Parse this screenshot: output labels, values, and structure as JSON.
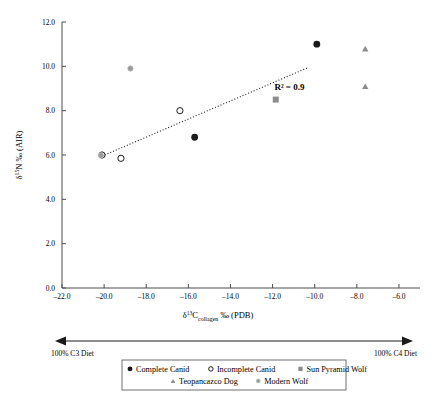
{
  "chart_data": {
    "type": "scatter",
    "title": "",
    "xlabel": "d13C collagen per mil (PDB)",
    "ylabel": "d15N per mil (AIR)",
    "xlabel_parts": {
      "delta": "δ",
      "sup": "13",
      "element": "C",
      "sub": "collagen",
      "tail": "‰ (PDB)"
    },
    "ylabel_parts": {
      "delta": "δ",
      "sup": "15",
      "element": "N",
      "tail": "‰ (AIR)"
    },
    "xlim": [
      -22.0,
      -5.0
    ],
    "ylim": [
      0.0,
      12.0
    ],
    "xticks": [
      -22.0,
      -20.0,
      -18.0,
      -16.0,
      -14.0,
      -12.0,
      -10.0,
      -8.0,
      -6.0
    ],
    "xtick_labels": [
      "–22.0",
      "–20.0",
      "–18.0",
      "–16.0",
      "–14.0",
      "–12.0",
      "–10.0",
      "–8.0",
      "–6.0"
    ],
    "yticks": [
      0.0,
      2.0,
      4.0,
      6.0,
      8.0,
      10.0,
      12.0
    ],
    "ytick_labels": [
      "0.0",
      "2.0",
      "4.0",
      "6.0",
      "8.0",
      "10.0",
      "12.0"
    ],
    "grid": false,
    "legend_position": "bottom-center",
    "annotations": [
      {
        "text": "R² = 0.9",
        "x": -11.2,
        "y": 8.95
      }
    ],
    "trendline": {
      "label": "R² = 0.9",
      "r_squared": 0.9,
      "style": "dotted",
      "x_start": -20.1,
      "y_start": 5.95,
      "x_end": -10.3,
      "y_end": 9.95
    },
    "series": [
      {
        "name": "Complete Canid",
        "marker": "filled-circle",
        "color": "#1a1a1a",
        "points": [
          {
            "x": -15.7,
            "y": 6.8
          },
          {
            "x": -9.9,
            "y": 11.0
          }
        ]
      },
      {
        "name": "Incomplete Canid",
        "marker": "open-circle",
        "color": "#1a1a1a",
        "points": [
          {
            "x": -20.1,
            "y": 6.0
          },
          {
            "x": -19.2,
            "y": 5.85
          },
          {
            "x": -16.4,
            "y": 8.0
          }
        ]
      },
      {
        "name": "Sun Pyramid Wolf",
        "marker": "filled-square",
        "color": "#8c8c8c",
        "points": [
          {
            "x": -11.85,
            "y": 8.5
          }
        ]
      },
      {
        "name": "Teopancazco Dog",
        "marker": "filled-triangle",
        "color": "#8c8c8c",
        "points": [
          {
            "x": -7.6,
            "y": 10.8
          },
          {
            "x": -7.6,
            "y": 9.1
          }
        ]
      },
      {
        "name": "Modern Wolf",
        "marker": "gray-dot",
        "color": "#9a9a9a",
        "points": [
          {
            "x": -18.75,
            "y": 9.9
          },
          {
            "x": -20.15,
            "y": 5.98
          }
        ]
      }
    ]
  },
  "diet_axis": {
    "left_label": "100% C3 Diet",
    "right_label": "100% C4 Diet"
  },
  "legend": {
    "rows": [
      [
        {
          "marker": "filled-circle",
          "label": "Complete Canid",
          "color": "#1a1a1a"
        },
        {
          "marker": "open-circle",
          "label": "Incomplete Canid",
          "color": "#1a1a1a"
        },
        {
          "marker": "filled-square",
          "label": "Sun Pyramid Wolf",
          "color": "#8c8c8c"
        }
      ],
      [
        {
          "marker": "filled-triangle",
          "label": "Teopancazco Dog",
          "color": "#8c8c8c"
        },
        {
          "marker": "gray-dot",
          "label": "Modern Wolf",
          "color": "#9a9a9a"
        }
      ]
    ]
  }
}
